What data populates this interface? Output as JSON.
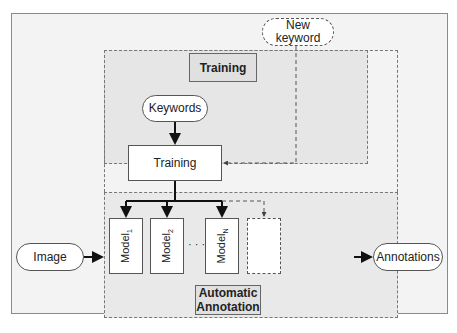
{
  "diagram": {
    "nodes": {
      "new_keyword": "New\nkeyword",
      "new_keyword_line1": "New",
      "new_keyword_line2": "keyword",
      "training_region_label": "Training",
      "keywords": "Keywords",
      "training_box": "Training",
      "image": "Image",
      "annotations": "Annotations",
      "annotation_region_label_line1": "Automatic",
      "annotation_region_label_line2": "Annotation",
      "models": [
        {
          "name": "Model",
          "subscript": "1"
        },
        {
          "name": "Model",
          "subscript": "2"
        },
        {
          "name": "Model",
          "subscript": "N"
        }
      ],
      "ellipsis": "· · ·"
    },
    "edges": [
      {
        "from": "Keywords",
        "to": "Training",
        "style": "solid"
      },
      {
        "from": "New keyword",
        "to": "Training",
        "style": "dashed"
      },
      {
        "from": "Training",
        "to": "Model1",
        "style": "solid"
      },
      {
        "from": "Training",
        "to": "Model2",
        "style": "solid"
      },
      {
        "from": "Training",
        "to": "ModelN",
        "style": "solid"
      },
      {
        "from": "Training",
        "to": "New model",
        "style": "dashed"
      },
      {
        "from": "Image",
        "to": "Automatic Annotation",
        "style": "solid"
      },
      {
        "from": "Automatic Annotation",
        "to": "Annotations",
        "style": "solid"
      }
    ]
  }
}
